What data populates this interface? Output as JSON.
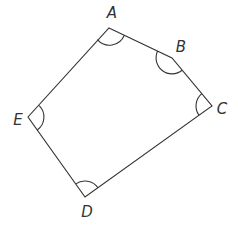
{
  "diagram": {
    "type": "pentagon",
    "stroke_color": "#333333",
    "background": "#ffffff",
    "vertices": [
      {
        "label": "A",
        "x": 109,
        "y": 28,
        "label_x": 112,
        "label_y": 18
      },
      {
        "label": "B",
        "x": 172,
        "y": 58,
        "label_x": 181,
        "label_y": 48
      },
      {
        "label": "C",
        "x": 212,
        "y": 106,
        "label_x": 221,
        "label_y": 110
      },
      {
        "label": "D",
        "x": 85,
        "y": 197,
        "label_x": 87,
        "label_y": 212
      },
      {
        "label": "E",
        "x": 28,
        "y": 117,
        "label_x": 18,
        "label_y": 121
      }
    ],
    "edges": [
      [
        "A",
        "B"
      ],
      [
        "B",
        "C"
      ],
      [
        "C",
        "D"
      ],
      [
        "D",
        "E"
      ],
      [
        "E",
        "A"
      ]
    ],
    "angle_marks": [
      "A",
      "B",
      "C",
      "D",
      "E"
    ]
  }
}
